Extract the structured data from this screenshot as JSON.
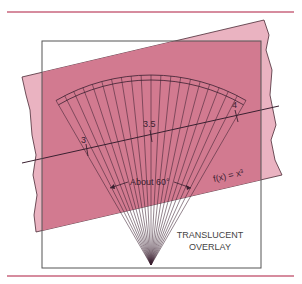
{
  "figure": {
    "labels": {
      "tick_3": "3",
      "tick_3_5": "3.5",
      "tick_4": "4",
      "angle_label": "About 60°",
      "function_label": "f(x) = x³",
      "overlay_label_line1": "TRANSLUCENT",
      "overlay_label_line2": "OVERLAY"
    },
    "colors": {
      "rule": "#c9667e",
      "strip_dark": "#d27a90",
      "strip_light": "#eab3c1",
      "frame": "#555555",
      "ink": "#3a2030"
    },
    "fan": {
      "ray_count": 21,
      "angle_degrees": 60
    }
  }
}
